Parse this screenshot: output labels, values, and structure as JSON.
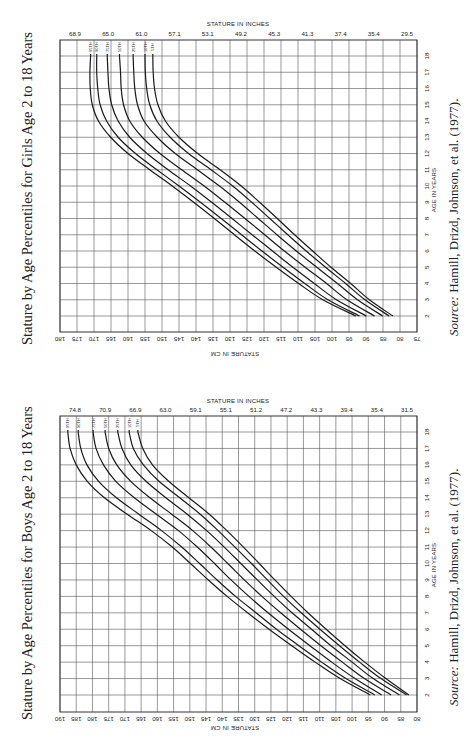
{
  "girls": {
    "title": "Stature by Age Percentiles for Girls Age 2 to 18 Years",
    "source_label": "Source:",
    "source_text": "Hamill, Drizd, Johnson, et al. (1977).",
    "top_axis_title": "STATURE IN INCHES",
    "bottom_axis_title": "STATURE IN CM",
    "age_axis_title": "AGE IN YEARS"
  },
  "boys": {
    "title": "Stature by Age Percentiles for Boys Age 2 to 18 Years",
    "source_label": "Source:",
    "source_text": "Hamill, Drizd, Johnson, et al. (1977).",
    "top_axis_title": "STATURE IN INCHES",
    "bottom_axis_title": "STATURE IN CM",
    "age_axis_title": "AGE IN YEARS"
  },
  "chart_data": [
    {
      "type": "line",
      "title": "Stature by Age Percentiles for Girls Age 2 to 18 Years",
      "xlabel": "AGE IN YEARS",
      "ylabel": "STATURE IN CM",
      "ylabel_secondary": "STATURE IN INCHES",
      "orientation": "rotated 90deg (age axis vertical on right, stature horizontal, decreasing left to right)",
      "x": [
        2,
        3,
        4,
        5,
        6,
        7,
        8,
        9,
        10,
        11,
        12,
        13,
        14,
        15,
        16,
        17,
        18
      ],
      "xlim": [
        2,
        18
      ],
      "ylim": [
        75,
        180
      ],
      "cm_ticks": [
        180,
        175,
        170,
        165,
        160,
        155,
        150,
        145,
        140,
        135,
        130,
        125,
        120,
        115,
        110,
        105,
        100,
        95,
        90,
        85,
        80,
        75
      ],
      "inch_ticks": [
        "68.9",
        "65.0",
        "61.0",
        "57.1",
        "53.1",
        "49.2",
        "45.3",
        "41.3",
        "37.4",
        "35.4",
        "29.5"
      ],
      "grid": true,
      "series": [
        {
          "name": "95TH",
          "values": [
            93.0,
            102.7,
            109.8,
            116.4,
            122.7,
            128.7,
            134.6,
            140.7,
            147.0,
            153.6,
            160.0,
            165.1,
            168.7,
            170.5,
            171.1,
            171.2,
            171.0
          ]
        },
        {
          "name": "90TH",
          "values": [
            91.9,
            101.2,
            108.0,
            114.4,
            120.6,
            126.6,
            132.6,
            138.7,
            145.0,
            151.5,
            157.8,
            162.9,
            166.3,
            168.2,
            168.9,
            169.2,
            169.2
          ]
        },
        {
          "name": "75TH",
          "values": [
            89.9,
            98.7,
            105.2,
            111.5,
            117.5,
            123.5,
            129.4,
            135.4,
            141.6,
            148.2,
            154.4,
            159.5,
            162.9,
            164.8,
            165.6,
            165.9,
            166.1
          ]
        },
        {
          "name": "50TH",
          "values": [
            87.5,
            95.6,
            101.6,
            107.9,
            114.0,
            119.8,
            125.6,
            131.5,
            137.6,
            144.2,
            150.6,
            155.8,
            159.5,
            161.3,
            162.0,
            162.2,
            162.5
          ]
        },
        {
          "name": "25TH",
          "values": [
            85.1,
            92.5,
            98.4,
            104.5,
            110.5,
            116.2,
            121.7,
            127.2,
            133.1,
            139.6,
            146.1,
            151.4,
            155.3,
            157.2,
            158.0,
            158.3,
            158.5
          ]
        },
        {
          "name": "10TH",
          "values": [
            83.2,
            90.3,
            96.0,
            101.9,
            107.6,
            113.0,
            118.3,
            123.6,
            129.2,
            135.6,
            142.2,
            147.6,
            151.5,
            153.6,
            154.5,
            154.9,
            155.0
          ]
        },
        {
          "name": "5TH",
          "values": [
            82.1,
            89.0,
            94.5,
            100.3,
            105.7,
            111.0,
            116.1,
            121.3,
            126.7,
            132.9,
            139.5,
            145.0,
            149.0,
            151.2,
            152.2,
            152.6,
            152.7
          ]
        }
      ]
    },
    {
      "type": "line",
      "title": "Stature by Age Percentiles for Boys Age 2 to 18 Years",
      "xlabel": "AGE IN YEARS",
      "ylabel": "STATURE IN CM",
      "ylabel_secondary": "STATURE IN INCHES",
      "orientation": "rotated 90deg (age axis vertical on right, stature horizontal, decreasing left to right)",
      "x": [
        2,
        3,
        4,
        5,
        6,
        7,
        8,
        9,
        10,
        11,
        12,
        13,
        14,
        15,
        16,
        17,
        18
      ],
      "xlim": [
        2,
        18
      ],
      "ylim": [
        80,
        190
      ],
      "cm_ticks": [
        190,
        185,
        180,
        175,
        170,
        165,
        160,
        155,
        150,
        145,
        140,
        135,
        130,
        125,
        120,
        115,
        110,
        105,
        100,
        95,
        90,
        85,
        80
      ],
      "inch_ticks": [
        "74.8",
        "70.9",
        "66.9",
        "63.0",
        "59.1",
        "55.1",
        "51.2",
        "47.2",
        "43.3",
        "39.4",
        "35.4",
        "31.5"
      ],
      "grid": true,
      "series": [
        {
          "name": "95TH",
          "values": [
            94.4,
            103.7,
            111.4,
            118.6,
            125.6,
            132.2,
            138.5,
            144.3,
            149.8,
            155.4,
            161.9,
            169.3,
            176.3,
            181.6,
            185.0,
            186.9,
            187.6
          ]
        },
        {
          "name": "90TH",
          "values": [
            93.0,
            101.9,
            109.4,
            116.4,
            123.3,
            129.6,
            135.9,
            141.6,
            147.0,
            152.5,
            158.7,
            165.7,
            172.6,
            178.1,
            181.7,
            183.6,
            184.4
          ]
        },
        {
          "name": "75TH",
          "values": [
            90.9,
            99.1,
            106.3,
            113.0,
            119.6,
            125.9,
            131.8,
            137.3,
            142.4,
            147.7,
            153.5,
            160.3,
            167.1,
            172.8,
            176.6,
            178.9,
            179.8
          ]
        },
        {
          "name": "50TH",
          "values": [
            88.0,
            96.2,
            103.0,
            109.6,
            115.9,
            122.0,
            127.8,
            133.2,
            138.3,
            143.5,
            149.1,
            155.6,
            162.3,
            168.2,
            172.5,
            175.0,
            176.1
          ]
        },
        {
          "name": "25TH",
          "values": [
            85.4,
            93.5,
            100.0,
            106.5,
            112.5,
            118.5,
            124.0,
            129.2,
            134.3,
            139.4,
            144.8,
            150.8,
            157.4,
            163.5,
            168.2,
            170.9,
            172.2
          ]
        },
        {
          "name": "10TH",
          "values": [
            83.2,
            91.1,
            97.7,
            103.9,
            109.9,
            115.7,
            121.1,
            126.1,
            131.0,
            136.1,
            141.3,
            146.8,
            153.1,
            159.5,
            164.3,
            167.4,
            168.7
          ]
        },
        {
          "name": "5TH",
          "values": [
            82.5,
            89.6,
            96.1,
            102.2,
            108.0,
            113.6,
            118.8,
            123.8,
            128.6,
            133.5,
            138.6,
            144.0,
            150.3,
            156.5,
            161.5,
            164.5,
            166.0
          ]
        }
      ]
    }
  ]
}
